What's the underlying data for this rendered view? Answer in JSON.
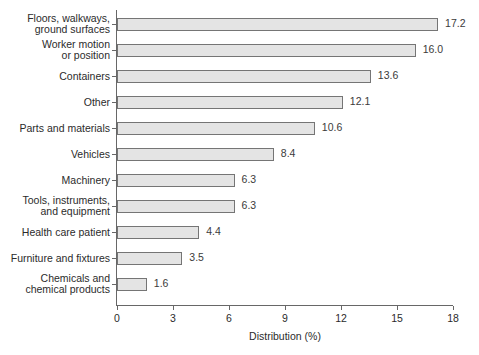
{
  "chart_data": {
    "type": "bar",
    "orientation": "horizontal",
    "title": "",
    "xlabel": "Distribution (%)",
    "ylabel": "",
    "xlim": [
      0,
      18
    ],
    "xticks": [
      0,
      3,
      6,
      9,
      12,
      15,
      18
    ],
    "xtick_labels": [
      "0",
      "3",
      "6",
      "9",
      "12",
      "15",
      "18"
    ],
    "grid": false,
    "legend": false,
    "categories": [
      "Floors, walkways,\nground surfaces",
      "Worker motion\nor position",
      "Containers",
      "Other",
      "Parts and materials",
      "Vehicles",
      "Machinery",
      "Tools, instruments,\nand equipment",
      "Health care patient",
      "Furniture and fixtures",
      "Chemicals and\nchemical products"
    ],
    "values": [
      17.2,
      16.0,
      13.6,
      12.1,
      10.6,
      8.4,
      6.3,
      6.3,
      4.4,
      3.5,
      1.6
    ],
    "value_labels": [
      "17.2",
      "16.0",
      "13.6",
      "12.1",
      "10.6",
      "8.4",
      "6.3",
      "6.3",
      "4.4",
      "3.5",
      "1.6"
    ],
    "bar_fill_color": "#e4e4e4",
    "bar_edge_color": "#757575",
    "axis_color": "#676767",
    "text_color": "#2b2b2b",
    "background_color": "#ffffff"
  }
}
